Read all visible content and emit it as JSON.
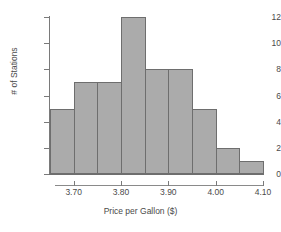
{
  "chart_data": {
    "type": "bar",
    "title": "",
    "subtitle": "",
    "xlabel": "Price per Gallon ($)",
    "ylabel": "# of Stations",
    "grid": false,
    "legend": "none",
    "bin_width": 0.05,
    "bin_edges": [
      3.65,
      3.7,
      3.75,
      3.8,
      3.85,
      3.9,
      3.95,
      4.0,
      4.05,
      4.1
    ],
    "categories": [
      "3.65-3.70",
      "3.70-3.75",
      "3.75-3.80",
      "3.80-3.85",
      "3.85-3.90",
      "3.90-3.95",
      "3.95-4.00",
      "4.00-4.05",
      "4.05-4.10"
    ],
    "values": [
      5,
      7,
      7,
      12,
      8,
      8,
      5,
      2,
      1
    ],
    "xlim": [
      3.65,
      4.1
    ],
    "ylim": [
      0,
      12
    ],
    "xticks": [
      3.7,
      3.8,
      3.9,
      4.0,
      4.1
    ],
    "xtick_labels": [
      "3.70",
      "3.80",
      "3.90",
      "4.00",
      "4.10"
    ],
    "yticks": [
      0,
      2,
      4,
      6,
      8,
      10,
      12
    ],
    "ytick_labels": [
      "0",
      "2",
      "4",
      "6",
      "8",
      "10",
      "12"
    ],
    "bar_fill_color": "#ababab",
    "bar_border_color": "#6e6e6e",
    "axis_color": "#7a7a7a",
    "text_color": "#4a4a4a",
    "background_color": "#ffffff"
  }
}
